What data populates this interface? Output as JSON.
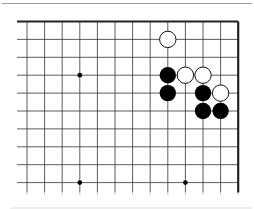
{
  "board": {
    "description": "Go board fragment, top-right corner view",
    "columns": 13,
    "rows": 10,
    "open_edges": [
      "left",
      "bottom"
    ],
    "closed_edges": [
      "top",
      "right"
    ],
    "origin_x": 27,
    "origin_y": 21.5,
    "spacing_x": 17.6,
    "spacing_y": 17.9,
    "line_color": "#333333",
    "edge_color": "#222222",
    "hoshi": [
      {
        "col": 3,
        "row": 3
      },
      {
        "col": 3,
        "row": 9
      },
      {
        "col": 9,
        "row": 9
      }
    ],
    "stones": [
      {
        "color": "white",
        "col": 8,
        "row": 1
      },
      {
        "color": "black",
        "col": 8,
        "row": 3
      },
      {
        "color": "white",
        "col": 9,
        "row": 3
      },
      {
        "color": "white",
        "col": 10,
        "row": 3
      },
      {
        "color": "black",
        "col": 8,
        "row": 4
      },
      {
        "color": "black",
        "col": 10,
        "row": 4
      },
      {
        "color": "white",
        "col": 11,
        "row": 4
      },
      {
        "color": "black",
        "col": 10,
        "row": 5
      },
      {
        "color": "black",
        "col": 11,
        "row": 5
      }
    ]
  },
  "colors": {
    "black_stone": "#000000",
    "white_stone": "#ffffff",
    "white_stone_outline": "#111111",
    "page_border": "#9a9a9a"
  }
}
